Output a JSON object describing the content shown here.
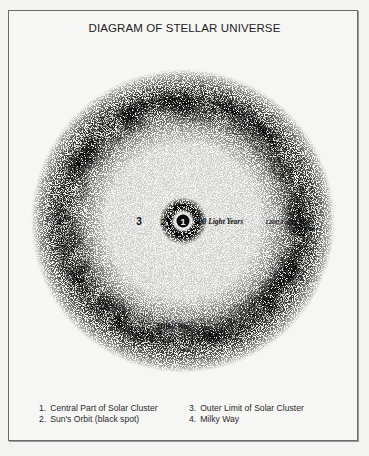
{
  "figure": {
    "title": "DIAGRAM OF STELLAR UNIVERSE",
    "center": {
      "x": 183,
      "y": 221
    },
    "colors": {
      "paper": "#f6f6f5",
      "ink": "#111111",
      "border": "#6a6a6a"
    },
    "markers": [
      {
        "id": "1",
        "label": "1"
      },
      {
        "id": "2",
        "label": "2"
      },
      {
        "id": "3",
        "label": "3"
      },
      {
        "id": "4",
        "label": "4"
      }
    ],
    "annotations": {
      "inner_distance": "300 Light Years",
      "outer_distance": "1200 Light Years",
      "outer_distance_sub": "2000",
      "milky_way": "Milky Way"
    }
  },
  "legend": [
    {
      "num": "1.",
      "text": "Central Part of Solar Cluster"
    },
    {
      "num": "3.",
      "text": "Outer Limit of Solar Cluster"
    },
    {
      "num": "2.",
      "text": "Sun's Orbit (black spot)"
    },
    {
      "num": "4.",
      "text": "Milky Way"
    }
  ]
}
